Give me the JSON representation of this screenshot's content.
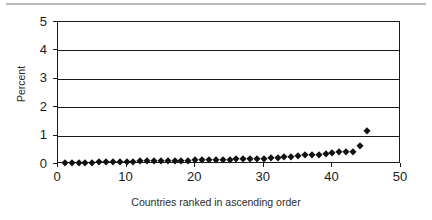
{
  "figure": {
    "name": "percent-by-country-scatter",
    "background": "#ffffff",
    "foreground": "#1a1a1a",
    "marker_color": "#111111",
    "top_rule_color": "#b9b9b9"
  },
  "chart_data": {
    "type": "scatter",
    "title": "",
    "subtitle": "",
    "xlabel": "Countries ranked in ascending order",
    "ylabel": "Percent",
    "xlim": [
      0,
      50
    ],
    "ylim": [
      0,
      5
    ],
    "xticks": [
      0,
      10,
      20,
      30,
      40,
      50
    ],
    "xtick_labels": [
      "0",
      "10",
      "20",
      "30",
      "40",
      "50"
    ],
    "yticks": [
      0,
      1,
      2,
      3,
      4,
      5
    ],
    "ytick_labels": [
      "0",
      "1",
      "2",
      "3",
      "4",
      "5"
    ],
    "grid": "horizontal",
    "legend": "none",
    "marker": "diamond",
    "series": [
      {
        "name": "Percent",
        "x": [
          1,
          2,
          3,
          4,
          5,
          6,
          7,
          8,
          9,
          10,
          11,
          12,
          13,
          14,
          15,
          16,
          17,
          18,
          19,
          20,
          21,
          22,
          23,
          24,
          25,
          26,
          27,
          28,
          29,
          30,
          31,
          32,
          33,
          34,
          35,
          36,
          37,
          38,
          39,
          40,
          41,
          42,
          43,
          44,
          45
        ],
        "y": [
          0.02,
          0.03,
          0.04,
          0.05,
          0.05,
          0.06,
          0.06,
          0.07,
          0.07,
          0.08,
          0.08,
          0.09,
          0.09,
          0.1,
          0.1,
          0.11,
          0.11,
          0.12,
          0.12,
          0.13,
          0.13,
          0.14,
          0.14,
          0.15,
          0.15,
          0.16,
          0.17,
          0.18,
          0.19,
          0.19,
          0.2,
          0.21,
          0.25,
          0.26,
          0.27,
          0.3,
          0.31,
          0.32,
          0.34,
          0.38,
          0.41,
          0.42,
          0.42,
          0.65,
          1.15
        ]
      }
    ]
  }
}
